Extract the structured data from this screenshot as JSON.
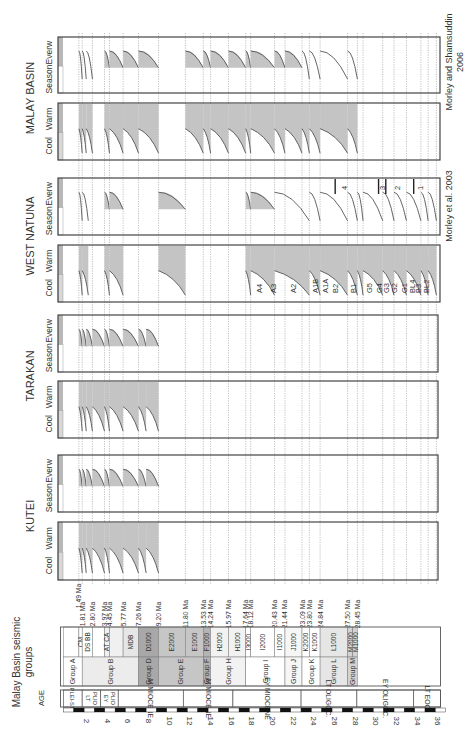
{
  "figure": {
    "orientation": "rotated-90-ccw",
    "x_axis": {
      "label": "AGE",
      "unit": "Ma",
      "ticks": [
        2,
        4,
        6,
        8,
        10,
        12,
        14,
        16,
        18,
        20,
        22,
        24,
        26,
        28,
        30,
        32,
        34,
        36
      ],
      "range": [
        0,
        36
      ]
    },
    "seismic_header": "Malay Basin seismic groups",
    "ages": [
      {
        "label": "PLEI-ST",
        "start": 0,
        "end": 1.81
      },
      {
        "label": "LT PLIO",
        "start": 1.81,
        "end": 3.6
      },
      {
        "label": "EY PLIO",
        "start": 3.6,
        "end": 5.3
      },
      {
        "label": "M MIOCENE",
        "start": 5.3,
        "end": 11.6
      },
      {
        "label": "M MIOCENE",
        "start": 11.6,
        "end": 16.4
      },
      {
        "label": "EY MIOCENE",
        "start": 16.4,
        "end": 23.0
      },
      {
        "label": "LT OLIGOC.",
        "start": 23.0,
        "end": 28.4
      },
      {
        "label": "EY OLIGOC.",
        "start": 28.4,
        "end": 33.9
      },
      {
        "label": "LT EOC.",
        "start": 33.9,
        "end": 36.5
      }
    ],
    "groups": [
      {
        "label": "Group A",
        "start": 0,
        "end": 1.81,
        "shade": "#ffffff"
      },
      {
        "label": "Group B",
        "start": 1.81,
        "end": 7.26,
        "shade": "#ececec"
      },
      {
        "label": "Group D",
        "start": 7.26,
        "end": 9.2,
        "shade": "#a8a8a8"
      },
      {
        "label": "Group E",
        "start": 9.2,
        "end": 13.53,
        "shade": "#c6c6c6"
      },
      {
        "label": "Group F",
        "start": 13.53,
        "end": 14.24,
        "shade": "#b4b4b4"
      },
      {
        "label": "Group H",
        "start": 14.24,
        "end": 17.64,
        "shade": "#f2f2f2"
      },
      {
        "label": "Group I",
        "start": 17.64,
        "end": 21.44,
        "shade": "#ffffff"
      },
      {
        "label": "Group J",
        "start": 21.44,
        "end": 23.09,
        "shade": "#f6f6f6"
      },
      {
        "label": "Group K",
        "start": 23.09,
        "end": 24.84,
        "shade": "#ffffff"
      },
      {
        "label": "Group L",
        "start": 24.84,
        "end": 27.5,
        "shade": "#e6e6e6"
      },
      {
        "label": "Group M",
        "start": 27.5,
        "end": 28.45,
        "shade": "#d2d2d2"
      }
    ],
    "subunits": [
      {
        "label": "",
        "start": 0,
        "end": 1.49,
        "shade": "#ffffff"
      },
      {
        "label": "CM",
        "start": 1.49,
        "end": 1.81,
        "shade": "#ffffff"
      },
      {
        "label": "DS  BB",
        "start": 1.81,
        "end": 2.8,
        "shade": "#ffffff"
      },
      {
        "label": "",
        "start": 2.8,
        "end": 3.97,
        "shade": "#ffffff"
      },
      {
        "label": "AT CA",
        "start": 3.97,
        "end": 4.45,
        "shade": "#f0f0f0"
      },
      {
        "label": "",
        "start": 4.45,
        "end": 5.77,
        "shade": "#f0f0f0"
      },
      {
        "label": "MDB",
        "start": 5.77,
        "end": 7.26,
        "shade": "#e6e6e6"
      },
      {
        "label": "D1000",
        "start": 7.26,
        "end": 9.2,
        "shade": "#a8a8a8"
      },
      {
        "label": "E2000",
        "start": 9.2,
        "end": 11.8,
        "shade": "#c6c6c6"
      },
      {
        "label": "E1000",
        "start": 11.8,
        "end": 13.53,
        "shade": "#c6c6c6"
      },
      {
        "label": "F1000",
        "start": 13.53,
        "end": 14.24,
        "shade": "#b4b4b4"
      },
      {
        "label": "H2000",
        "start": 14.24,
        "end": 15.97,
        "shade": "#f2f2f2"
      },
      {
        "label": "H1000",
        "start": 15.97,
        "end": 17.64,
        "shade": "#f2f2f2"
      },
      {
        "label": "I3000",
        "start": 17.64,
        "end": 18.12,
        "shade": "#ffffff"
      },
      {
        "label": "I2000",
        "start": 18.12,
        "end": 20.43,
        "shade": "#ffffff"
      },
      {
        "label": "I1000",
        "start": 20.43,
        "end": 21.44,
        "shade": "#ffffff"
      },
      {
        "label": "J1000",
        "start": 21.44,
        "end": 23.09,
        "shade": "#f6f6f6"
      },
      {
        "label": "K2000",
        "start": 23.09,
        "end": 23.8,
        "shade": "#ffffff"
      },
      {
        "label": "K1000",
        "start": 23.8,
        "end": 24.84,
        "shade": "#ffffff"
      },
      {
        "label": "L1000",
        "start": 24.84,
        "end": 27.5,
        "shade": "#e6e6e6"
      },
      {
        "label": "M2000",
        "start": 27.5,
        "end": 28.0,
        "shade": "#d2d2d2"
      },
      {
        "label": "M1000",
        "start": 28.0,
        "end": 28.45,
        "shade": "#d2d2d2"
      }
    ],
    "boundaries_ma": [
      1.49,
      1.81,
      2.8,
      3.97,
      4.45,
      5.77,
      7.26,
      9.2,
      11.8,
      13.53,
      14.24,
      15.97,
      17.64,
      18.12,
      20.43,
      21.44,
      23.09,
      23.8,
      24.84,
      27.5,
      28.45
    ],
    "boundary_labels": [
      "1.49 Ma",
      "1.81 Ma",
      "2.80 Ma",
      "3.97 Ma",
      "4.45 Ma",
      "5.77 Ma",
      "7.26 Ma",
      "9.20 Ma",
      "11.80 Ma",
      "13.53 Ma",
      "14.24 Ma",
      "15.97 Ma",
      "17.64 Ma",
      "18.12 Ma",
      "20.43 Ma",
      "21.44 Ma",
      "23.09 Ma",
      "23.80 Ma",
      "24.84 Ma",
      "27.50 Ma",
      "28.45 Ma"
    ],
    "regions": [
      {
        "name": "MALAY BASIN",
        "source": "Morley and Shamsuddin 2006",
        "extent_ma": 28.45
      },
      {
        "name": "WEST NATUNA",
        "source": "Morley et al. 2003",
        "extent_ma": 36.0
      },
      {
        "name": "TARAKAN",
        "source": "",
        "extent_ma": 9.2
      },
      {
        "name": "KUTEI",
        "source": "",
        "extent_ma": 9.2
      }
    ],
    "panel_labels": {
      "climate_a": [
        "Cool",
        "Warm"
      ],
      "climate_b": [
        "Season",
        "Everw"
      ]
    },
    "west_natuna_units": [
      "A4",
      "A3",
      "A2",
      "A1B",
      "A1A",
      "B2",
      "B1",
      "G5",
      "G4",
      "G3",
      "G2",
      "G1",
      "BL4",
      "B3",
      "BL2"
    ],
    "west_natuna_zones": [
      "4",
      "3",
      "2",
      "1"
    ]
  }
}
